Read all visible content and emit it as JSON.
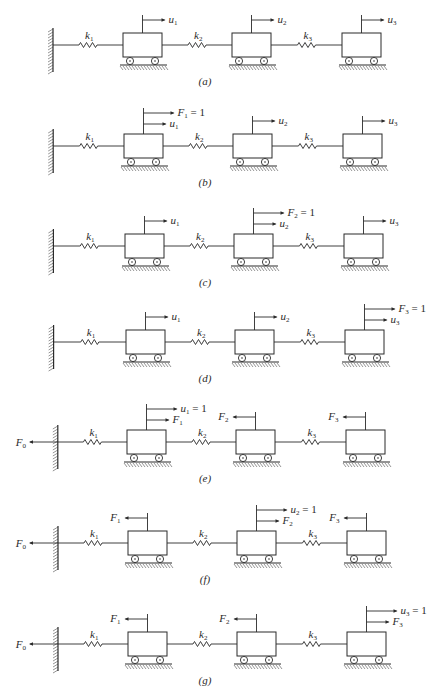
{
  "figure": {
    "stroke_color": "#2a2a2a",
    "background": "#ffffff",
    "panels": [
      {
        "caption": "(a)",
        "y": 45,
        "dx": 0,
        "wall_force": null,
        "springs": [
          "k1",
          "k2",
          "k3"
        ],
        "masses": [
          {
            "arrows": [
              {
                "dir": "right",
                "label": "u1",
                "sub": "1",
                "base": "u",
                "suffix": ""
              }
            ]
          },
          {
            "arrows": [
              {
                "dir": "right",
                "label": "u2",
                "sub": "2",
                "base": "u",
                "suffix": ""
              }
            ]
          },
          {
            "arrows": [
              {
                "dir": "right",
                "label": "u3",
                "sub": "3",
                "base": "u",
                "suffix": ""
              }
            ]
          }
        ]
      },
      {
        "caption": "(b)",
        "y": 146,
        "dx": 1,
        "wall_force": null,
        "springs": [
          "k1",
          "k2",
          "k3"
        ],
        "masses": [
          {
            "arrows": [
              {
                "dir": "right",
                "label": "F1 = 1",
                "sub": "1",
                "base": "F",
                "suffix": " = 1"
              },
              {
                "dir": "right",
                "label": "u1",
                "sub": "1",
                "base": "u",
                "suffix": ""
              }
            ]
          },
          {
            "arrows": [
              {
                "dir": "right",
                "label": "u2",
                "sub": "2",
                "base": "u",
                "suffix": ""
              }
            ]
          },
          {
            "arrows": [
              {
                "dir": "right",
                "label": "u3",
                "sub": "3",
                "base": "u",
                "suffix": ""
              }
            ]
          }
        ]
      },
      {
        "caption": "(c)",
        "y": 246,
        "dx": 2,
        "wall_force": null,
        "springs": [
          "k1",
          "k2",
          "k3"
        ],
        "masses": [
          {
            "arrows": [
              {
                "dir": "right",
                "label": "u1",
                "sub": "1",
                "base": "u",
                "suffix": ""
              }
            ]
          },
          {
            "arrows": [
              {
                "dir": "right",
                "label": "F2 = 1",
                "sub": "2",
                "base": "F",
                "suffix": " = 1"
              },
              {
                "dir": "right",
                "label": "u2",
                "sub": "2",
                "base": "u",
                "suffix": ""
              }
            ]
          },
          {
            "arrows": [
              {
                "dir": "right",
                "label": "u3",
                "sub": "3",
                "base": "u",
                "suffix": ""
              }
            ]
          }
        ]
      },
      {
        "caption": "(d)",
        "y": 342,
        "dx": 3,
        "wall_force": null,
        "springs": [
          "k1",
          "k2",
          "k3"
        ],
        "masses": [
          {
            "arrows": [
              {
                "dir": "right",
                "label": "u1",
                "sub": "1",
                "base": "u",
                "suffix": ""
              }
            ]
          },
          {
            "arrows": [
              {
                "dir": "right",
                "label": "u2",
                "sub": "2",
                "base": "u",
                "suffix": ""
              }
            ]
          },
          {
            "arrows": [
              {
                "dir": "right",
                "label": "F3 = 1",
                "sub": "3",
                "base": "F",
                "suffix": " = 1"
              },
              {
                "dir": "right",
                "label": "u3",
                "sub": "3",
                "base": "u",
                "suffix": ""
              }
            ]
          }
        ]
      },
      {
        "caption": "(e)",
        "y": 442,
        "dx": 4,
        "wall_force": {
          "label": "F0",
          "base": "F",
          "sub": "0"
        },
        "springs": [
          "k1",
          "k2",
          "k3"
        ],
        "masses": [
          {
            "arrows": [
              {
                "dir": "right",
                "label": "u1 = 1",
                "sub": "1",
                "base": "u",
                "suffix": " = 1"
              },
              {
                "dir": "right",
                "label": "F1",
                "sub": "1",
                "base": "F",
                "suffix": ""
              }
            ]
          },
          {
            "arrows": [
              {
                "dir": "left",
                "label": "F2",
                "sub": "2",
                "base": "F",
                "suffix": ""
              }
            ]
          },
          {
            "arrows": [
              {
                "dir": "left",
                "label": "F3",
                "sub": "3",
                "base": "F",
                "suffix": ""
              }
            ]
          }
        ]
      },
      {
        "caption": "(f)",
        "y": 543,
        "dx": 5,
        "wall_force": {
          "label": "F0",
          "base": "F",
          "sub": "0"
        },
        "springs": [
          "k1",
          "k2",
          "k3"
        ],
        "masses": [
          {
            "arrows": [
              {
                "dir": "left",
                "label": "F1",
                "sub": "1",
                "base": "F",
                "suffix": ""
              }
            ]
          },
          {
            "arrows": [
              {
                "dir": "right",
                "label": "u2 = 1",
                "sub": "2",
                "base": "u",
                "suffix": " = 1"
              },
              {
                "dir": "right",
                "label": "F2",
                "sub": "2",
                "base": "F",
                "suffix": ""
              }
            ]
          },
          {
            "arrows": [
              {
                "dir": "left",
                "label": "F3",
                "sub": "3",
                "base": "F",
                "suffix": ""
              }
            ]
          }
        ]
      },
      {
        "caption": "(g)",
        "y": 644,
        "dx": 5,
        "wall_force": {
          "label": "F0",
          "base": "F",
          "sub": "0"
        },
        "springs": [
          "k1",
          "k2",
          "k3"
        ],
        "masses": [
          {
            "arrows": [
              {
                "dir": "left",
                "label": "F1",
                "sub": "1",
                "base": "F",
                "suffix": ""
              }
            ]
          },
          {
            "arrows": [
              {
                "dir": "left",
                "label": "F2",
                "sub": "2",
                "base": "F",
                "suffix": ""
              }
            ]
          },
          {
            "arrows": [
              {
                "dir": "right",
                "label": "u3 = 1",
                "sub": "3",
                "base": "u",
                "suffix": " = 1"
              },
              {
                "dir": "right",
                "label": "F3",
                "sub": "3",
                "base": "F",
                "suffix": ""
              }
            ]
          }
        ]
      }
    ]
  }
}
